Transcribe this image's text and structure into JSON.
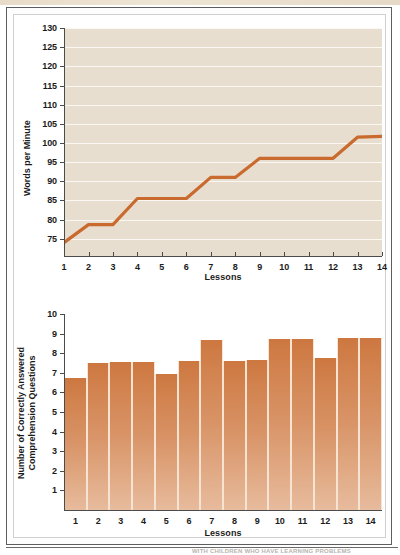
{
  "page": {
    "bottom_caption": "WITH CHILDREN WHO HAVE LEARNING PROBLEMS",
    "background_color": "#ffffff",
    "frame_color": "#5e5e5e"
  },
  "colors": {
    "line": "#c96a2e",
    "plot_background": "#e8ded0",
    "gridline": "#fbf8f3",
    "bar_top": "#cd7740",
    "bar_bottom": "#e7bb9d",
    "axis": "#4b4b4b",
    "text": "#1b1b1b"
  },
  "charts": [
    {
      "id": "words-per-minute-line-chart",
      "ylabel": "Words per Minute",
      "xlabel": "Lessons",
      "y_ticks": [
        75,
        80,
        85,
        90,
        95,
        100,
        105,
        110,
        115,
        120,
        125,
        130
      ],
      "x_ticks": [
        1,
        2,
        3,
        4,
        5,
        6,
        7,
        8,
        9,
        10,
        11,
        12,
        13,
        14
      ]
    },
    {
      "id": "comprehension-questions-bar-chart",
      "ylabel": "Number of Correctly Answered Comprehension Questions",
      "xlabel": "Lessons",
      "y_ticks": [
        1,
        2,
        3,
        4,
        5,
        6,
        7,
        8,
        9,
        10
      ],
      "x_ticks": [
        1,
        2,
        3,
        4,
        5,
        6,
        7,
        8,
        9,
        10,
        11,
        12,
        13,
        14
      ]
    }
  ],
  "chart_data": [
    {
      "type": "line",
      "title": "",
      "subtitle": "",
      "xlabel": "Lessons",
      "ylabel": "Words per Minute",
      "x": [
        1,
        2,
        3,
        4,
        5,
        6,
        7,
        8,
        9,
        10,
        11,
        12,
        13,
        14
      ],
      "values": [
        74,
        78.7,
        78.7,
        85.5,
        85.5,
        85.5,
        91,
        91,
        96,
        96,
        96,
        96,
        101.5,
        101.7
      ],
      "series": [
        {
          "name": "Words per Minute",
          "values": [
            74,
            78.7,
            78.7,
            85.5,
            85.5,
            85.5,
            91,
            91,
            96,
            96,
            96,
            96,
            101.5,
            101.7
          ],
          "color": "#c96a2e"
        }
      ],
      "ylim": [
        70.5,
        130
      ],
      "xlim": [
        1,
        14
      ],
      "yticks": [
        75,
        80,
        85,
        90,
        95,
        100,
        105,
        110,
        115,
        120,
        125,
        130
      ],
      "xticks": [
        1,
        2,
        3,
        4,
        5,
        6,
        7,
        8,
        9,
        10,
        11,
        12,
        13,
        14
      ],
      "grid": "horizontal",
      "legend": "none",
      "annotations": []
    },
    {
      "type": "bar",
      "title": "",
      "subtitle": "",
      "xlabel": "Lessons",
      "ylabel": "Number of Correctly Answered Comprehension Questions",
      "categories": [
        "1",
        "2",
        "3",
        "4",
        "5",
        "6",
        "7",
        "8",
        "9",
        "10",
        "11",
        "12",
        "13",
        "14"
      ],
      "values": [
        6.75,
        7.5,
        7.55,
        7.55,
        6.95,
        7.6,
        8.65,
        7.6,
        7.65,
        8.75,
        8.75,
        7.75,
        8.8,
        8.8
      ],
      "series": [
        {
          "name": "Correctly Answered Comprehension Questions",
          "values": [
            6.75,
            7.5,
            7.55,
            7.55,
            6.95,
            7.6,
            8.65,
            7.6,
            7.65,
            8.75,
            8.75,
            7.75,
            8.8,
            8.8
          ],
          "color": "#d2834f"
        }
      ],
      "ylim": [
        0,
        10
      ],
      "yticks": [
        1,
        2,
        3,
        4,
        5,
        6,
        7,
        8,
        9,
        10
      ],
      "xticks": [
        "1",
        "2",
        "3",
        "4",
        "5",
        "6",
        "7",
        "8",
        "9",
        "10",
        "11",
        "12",
        "13",
        "14"
      ],
      "grid": "none",
      "legend": "none",
      "annotations": []
    }
  ]
}
